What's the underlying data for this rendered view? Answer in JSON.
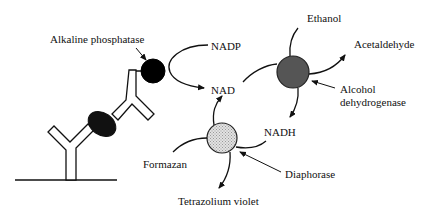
{
  "diagram": {
    "labels": {
      "alkaline_phosphatase": "Alkaline phosphatase",
      "nadp": "NADP",
      "nad": "NAD",
      "ethanol": "Ethanol",
      "acetaldehyde": "Acetaldehyde",
      "alcohol_dehydrogenase_line1": "Alcohol",
      "alcohol_dehydrogenase_line2": "dehydrogenase",
      "nadh": "NADH",
      "formazan": "Formazan",
      "diaphorase": "Diaphorase",
      "tetrazolium_violet": "Tetrazolium violet"
    },
    "colors": {
      "alkaline_phosphatase_fill": "#000000",
      "antigen_fill": "#111111",
      "alcohol_dehydrogenase_fill": "#555555",
      "diaphorase_fill": "#d0d0d0",
      "stroke": "#111111"
    }
  }
}
